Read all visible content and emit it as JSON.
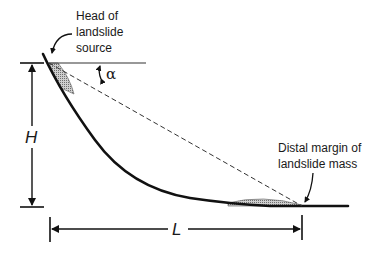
{
  "diagram": {
    "labels": {
      "head": [
        "Head of",
        "landslide",
        "source"
      ],
      "distal": [
        "Distal margin of",
        "landslide mass"
      ],
      "height": "H",
      "length": "L",
      "angle": "α"
    },
    "colors": {
      "line": "#111111",
      "stipple": "#9a9a9a",
      "background": "#ffffff"
    }
  }
}
